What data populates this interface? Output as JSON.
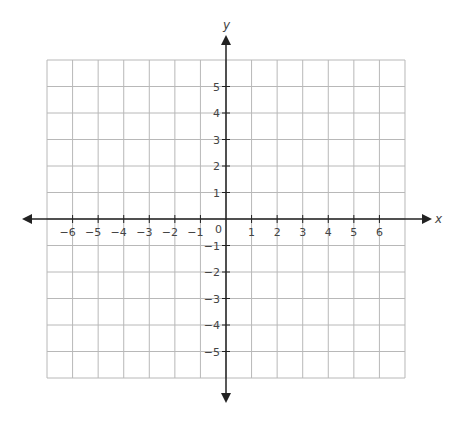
{
  "chart_data": {
    "type": "coordinate-plane",
    "title": "",
    "xlabel": "x",
    "ylabel": "y",
    "xlim": [
      -7,
      7
    ],
    "ylim": [
      -6,
      6
    ],
    "grid": true,
    "x_ticks": [
      -6,
      -5,
      -4,
      -3,
      -2,
      -1,
      1,
      2,
      3,
      4,
      5,
      6
    ],
    "y_ticks": [
      5,
      4,
      3,
      2,
      1,
      -1,
      -2,
      -3,
      -4,
      -5
    ],
    "x_tick_labels": [
      "−6",
      "−5",
      "−4",
      "−3",
      "−2",
      "−1",
      "1",
      "2",
      "3",
      "4",
      "5",
      "6"
    ],
    "y_tick_labels": [
      "5",
      "4",
      "3",
      "2",
      "1",
      "−1",
      "−2",
      "−3",
      "−4",
      "−5"
    ],
    "origin_label": "0",
    "series": []
  },
  "colors": {
    "grid": "#b8b8b8",
    "axis": "#222222",
    "text": "#444444"
  }
}
